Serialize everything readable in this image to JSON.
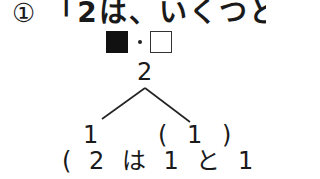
{
  "question": {
    "number_mark": "①",
    "text": "「2は、いくつと"
  },
  "legend": {
    "filled_square": "■",
    "separator": "・",
    "empty_square": "□"
  },
  "number_bond": {
    "top": "2",
    "left": "1",
    "right": "( 1 )",
    "answer": "( 2 は 1 と 1 )"
  },
  "colors": {
    "text": "#1a1a1a",
    "background": "#ffffff"
  }
}
